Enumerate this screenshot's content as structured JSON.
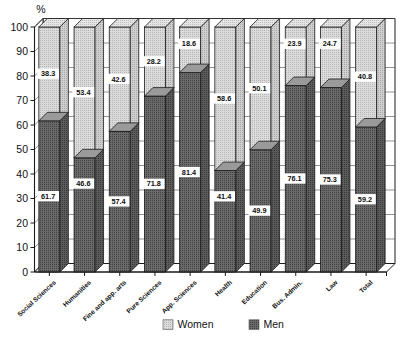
{
  "chart_data": {
    "type": "bar",
    "subtype": "stacked-bar-3d",
    "title": "",
    "xlabel": "",
    "ylabel": "%",
    "ylim": [
      0,
      100
    ],
    "yticks": [
      0,
      10,
      20,
      30,
      40,
      50,
      60,
      70,
      80,
      90,
      100
    ],
    "ytick_labels": [
      "0",
      "10",
      "20",
      "30",
      "40",
      "50",
      "60",
      "70",
      "80",
      "90",
      "100"
    ],
    "grid": true,
    "legend_position": "bottom",
    "stacked_total": 100,
    "categories": [
      "Social Sciences",
      "Humanities",
      "Fine and app. arts",
      "Pure Sciences",
      "App. Sciences",
      "Health",
      "Education",
      "Bus. Admin.",
      "Law",
      "Total"
    ],
    "series": [
      {
        "name": "Men",
        "color": "#5b5b5b",
        "pattern": "dark-dots",
        "values": [
          61.7,
          46.6,
          57.4,
          71.8,
          81.4,
          41.4,
          49.9,
          76.1,
          75.3,
          59.2
        ]
      },
      {
        "name": "Women",
        "color": "#cdcdcd",
        "pattern": "light-dots",
        "values": [
          38.3,
          53.4,
          42.6,
          28.2,
          18.6,
          58.6,
          50.1,
          23.9,
          24.7,
          40.8
        ]
      }
    ],
    "data_labels": {
      "men": [
        "61.7",
        "46.6",
        "57.4",
        "71.8",
        "81.4",
        "41.4",
        "49.9",
        "76.1",
        "75.3",
        "59.2"
      ],
      "women": [
        "38.3",
        "53.4",
        "42.6",
        "28.2",
        "18.6",
        "58.6",
        "50.1",
        "23.9",
        "24.7",
        "40.8"
      ]
    }
  },
  "legend": {
    "items": [
      {
        "label": "Women",
        "color": "#cdcdcd"
      },
      {
        "label": "Men",
        "color": "#5b5b5b"
      }
    ]
  },
  "axis": {
    "y_unit": "%"
  }
}
